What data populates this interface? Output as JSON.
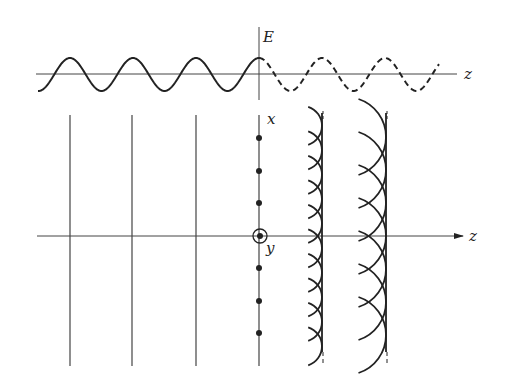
{
  "figure": {
    "colors": {
      "ink": "#222222",
      "background": "#ffffff"
    },
    "top_plot": {
      "axis_label_vertical": "E",
      "axis_label_horizontal": "z",
      "h_axis": {
        "x1": 36,
        "x2": 457,
        "y": 74
      },
      "v_axis": {
        "x": 259,
        "y1": 27,
        "y2": 100
      },
      "wave": {
        "center_y": 74.5,
        "amplitude": 16.5,
        "period": 63,
        "peak_x": 259,
        "solid_from": 38,
        "solid_to": 259,
        "dashed_from": 259,
        "dashed_to": 439
      }
    },
    "bottom_plot": {
      "axis_label_x": "x",
      "axis_label_y": "y",
      "axis_label_z": "z",
      "z_axis": {
        "x1": 37,
        "x2": 463,
        "y": 236
      },
      "incident_fronts_x": [
        70,
        132,
        196
      ],
      "fronts_y1": 115,
      "fronts_y2": 366,
      "interface_x": 259,
      "dots_y": [
        138,
        171,
        203,
        268,
        301,
        333
      ],
      "origin": {
        "x": 260,
        "y": 236,
        "r": 7
      },
      "wavefronts": [
        {
          "envelope_x": 322,
          "arc_radius": 20,
          "spacing": 24.5,
          "count": 10,
          "solid_y1": 113,
          "solid_y2": 352,
          "dash_y2": 366
        },
        {
          "envelope_x": 386,
          "arc_radius": 40,
          "spacing": 33,
          "count": 7,
          "solid_y1": 113,
          "solid_y2": 352,
          "dash_y2": 366
        }
      ]
    }
  }
}
